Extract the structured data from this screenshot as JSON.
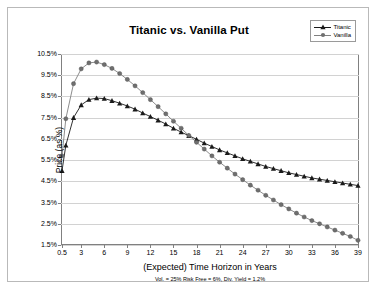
{
  "chart_data": {
    "type": "line",
    "title": "Titanic vs. Vanilla Put",
    "xlabel": "(Expected) Time Horizon in Years",
    "sublabel": "Vol. = 25% Risk Free = 6%, Div. Yield = 1.2%",
    "ylabel": "Price (as %)",
    "xlim": [
      0.5,
      39
    ],
    "ylim": [
      1.5,
      10.5
    ],
    "grid": true,
    "legend_position": "top-right",
    "xticks": [
      0.5,
      3,
      6,
      9,
      12,
      15,
      18,
      21,
      24,
      27,
      30,
      33,
      36,
      39
    ],
    "xtick_labels": [
      "0.5",
      "3",
      "6",
      "9",
      "12",
      "15",
      "18",
      "21",
      "24",
      "27",
      "30",
      "33",
      "36",
      "39"
    ],
    "yticks": [
      1.5,
      2.5,
      3.5,
      4.5,
      5.5,
      6.5,
      7.5,
      8.5,
      9.5,
      10.5
    ],
    "ytick_labels": [
      "1.5%",
      "2.5%",
      "3.5%",
      "4.5%",
      "5.5%",
      "6.5%",
      "7.5%",
      "8.5%",
      "9.5%",
      "10.5%"
    ],
    "x": [
      0.5,
      1,
      2,
      3,
      4,
      5,
      6,
      7,
      8,
      9,
      10,
      11,
      12,
      13,
      14,
      15,
      16,
      17,
      18,
      19,
      20,
      21,
      22,
      23,
      24,
      25,
      26,
      27,
      28,
      29,
      30,
      31,
      32,
      33,
      34,
      35,
      36,
      37,
      38,
      39
    ],
    "series": [
      {
        "name": "Titanic",
        "marker": "triangle",
        "color": "#1a1a1a",
        "values": [
          5.0,
          6.2,
          7.5,
          8.1,
          8.35,
          8.42,
          8.4,
          8.3,
          8.18,
          8.05,
          7.9,
          7.72,
          7.55,
          7.38,
          7.2,
          7.0,
          6.82,
          6.65,
          6.48,
          6.3,
          6.14,
          5.98,
          5.84,
          5.7,
          5.56,
          5.44,
          5.32,
          5.2,
          5.1,
          5.0,
          4.9,
          4.82,
          4.74,
          4.66,
          4.6,
          4.54,
          4.48,
          4.42,
          4.36,
          4.3
        ]
      },
      {
        "name": "Vanilla",
        "marker": "circle",
        "color": "#808080",
        "values": [
          5.7,
          7.45,
          9.1,
          9.8,
          10.08,
          10.12,
          10.0,
          9.82,
          9.58,
          9.3,
          9.0,
          8.68,
          8.35,
          8.02,
          7.68,
          7.33,
          7.0,
          6.66,
          6.34,
          6.02,
          5.7,
          5.4,
          5.12,
          4.84,
          4.58,
          4.32,
          4.08,
          3.84,
          3.62,
          3.4,
          3.2,
          3.0,
          2.82,
          2.65,
          2.5,
          2.35,
          2.2,
          2.05,
          1.9,
          1.72
        ]
      }
    ]
  },
  "legend": {
    "entries": [
      {
        "label": "Titanic"
      },
      {
        "label": "Vanilla"
      }
    ]
  }
}
